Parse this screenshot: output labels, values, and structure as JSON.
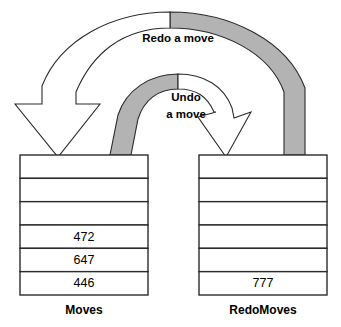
{
  "diagram": {
    "colors": {
      "stroke": "#2b2b2b",
      "fill_white": "#ffffff",
      "fill_gray": "#b3b3b3",
      "text": "#000000",
      "background": "#ffffff"
    },
    "arrows": [
      {
        "id": "redo-arrow",
        "label": "Redo a move",
        "label_lines": [
          "Redo a move"
        ],
        "direction": "RedoMoves to Moves",
        "tail_style": "gray",
        "head_style": "white"
      },
      {
        "id": "undo-arrow",
        "label": "Undo a move",
        "label_lines": [
          "Undo",
          "a move"
        ],
        "direction": "Moves to RedoMoves",
        "tail_style": "gray",
        "head_style": "white"
      }
    ],
    "stacks": [
      {
        "id": "moves-stack",
        "caption": "Moves",
        "cells": [
          "",
          "",
          "",
          "472",
          "647",
          "446"
        ]
      },
      {
        "id": "redomoves-stack",
        "caption": "RedoMoves",
        "cells": [
          "",
          "",
          "",
          "",
          "",
          "777"
        ]
      }
    ]
  }
}
